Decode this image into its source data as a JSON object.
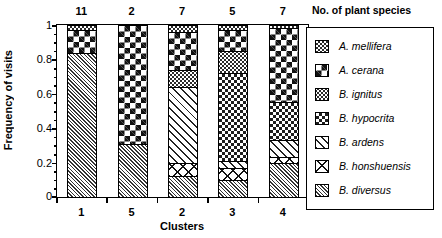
{
  "chart_data": {
    "type": "bar",
    "subtype": "stacked-100-percent",
    "title": "",
    "xlabel": "Clusters",
    "ylabel": "Frequency of visits",
    "ylim": [
      0,
      1
    ],
    "yticks": [
      "0",
      "0.2",
      "0.4",
      "0.6",
      "0.8",
      "1"
    ],
    "ytick_values": [
      0,
      0.2,
      0.4,
      0.6,
      0.8,
      1
    ],
    "minor_ticks": true,
    "grid": false,
    "legend_position": "right",
    "legend_title": "No. of plant species",
    "top_annotation_label": "No. of plant species",
    "categories": [
      "1",
      "5",
      "2",
      "3",
      "4"
    ],
    "top_annotations": [
      "11",
      "2",
      "7",
      "5",
      "7"
    ],
    "series": [
      {
        "name": "A. mellifera",
        "pattern": "fine-dotted-checker",
        "values": [
          0.03,
          0.0,
          0.04,
          0.03,
          0.02
        ]
      },
      {
        "name": "A. cerana",
        "pattern": "large-checkerboard",
        "values": [
          0.13,
          0.69,
          0.22,
          0.12,
          0.43
        ]
      },
      {
        "name": "B. ignitus",
        "pattern": "dark-speckle",
        "values": [
          0.0,
          0.0,
          0.1,
          0.13,
          0.0
        ]
      },
      {
        "name": "B. hypocrita",
        "pattern": "medium-checker",
        "values": [
          0.0,
          0.0,
          0.0,
          0.51,
          0.22
        ]
      },
      {
        "name": "B. ardens",
        "pattern": "wide-diagonal-hatch",
        "values": [
          0.0,
          0.0,
          0.44,
          0.04,
          0.1
        ]
      },
      {
        "name": "B. honshuensis",
        "pattern": "open-cross-hatch",
        "values": [
          0.0,
          0.0,
          0.08,
          0.07,
          0.03
        ]
      },
      {
        "name": "B. diversus",
        "pattern": "fine-diagonal-hatch",
        "values": [
          0.84,
          0.31,
          0.12,
          0.1,
          0.2
        ]
      }
    ]
  },
  "axes": {
    "y_title": "Frequency of visits",
    "x_title": "Clusters",
    "y_labels": [
      "1",
      "0.8",
      "0.6",
      "0.4",
      "0.2",
      "0"
    ],
    "x_labels": [
      "1",
      "5",
      "2",
      "3",
      "4"
    ]
  },
  "counts": {
    "header": "No. of plant species",
    "values": [
      "11",
      "2",
      "7",
      "5",
      "7"
    ]
  },
  "legend": {
    "items": [
      {
        "label": "A. mellifera"
      },
      {
        "label": "A. cerana"
      },
      {
        "label": "B. ignitus"
      },
      {
        "label": "B. hypocrita"
      },
      {
        "label": "B. ardens"
      },
      {
        "label": "B. honshuensis"
      },
      {
        "label": "B. diversus"
      }
    ]
  },
  "colors": {
    "ink": "#000000",
    "background": "#ffffff"
  }
}
